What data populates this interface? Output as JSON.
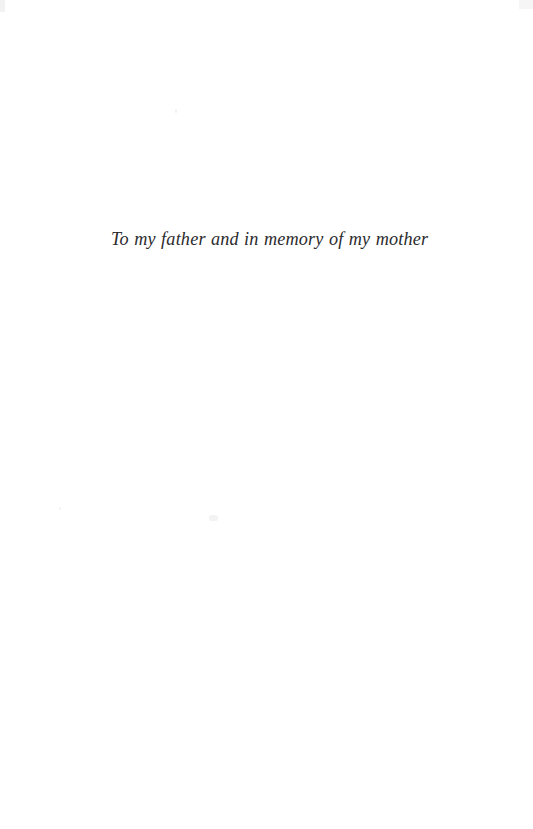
{
  "page": {
    "width": 533,
    "height": 829,
    "background_color": "#ffffff",
    "kind": "book-dedication-page"
  },
  "dedication": {
    "text": "To my father and in memory of my mother",
    "style": "italic-serif",
    "text_color": "#2b2b2d"
  },
  "artifacts": {
    "corner_smudge_top_left": "",
    "corner_smudge_top_right": "",
    "speck_upper": "",
    "speck_mid_left": "",
    "speck_mid_center": ""
  }
}
